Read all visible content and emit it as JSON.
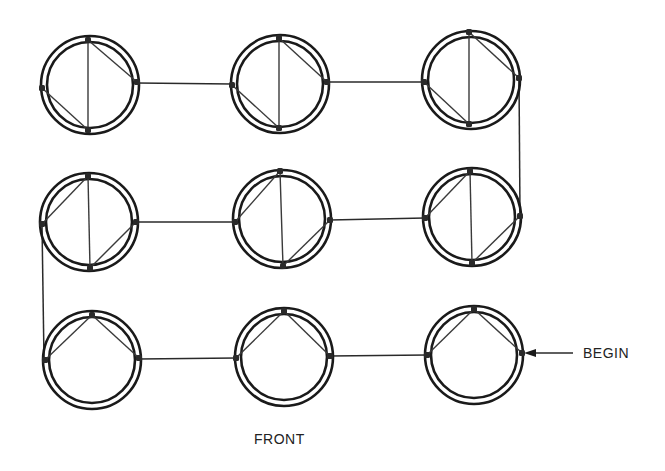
{
  "diagram": {
    "colors": {
      "stroke": "#1a1a1a",
      "background": "#ffffff"
    },
    "ring": {
      "outer_r": 49,
      "inner_r": 43
    },
    "labels": {
      "begin": "BEGIN",
      "front": "FRONT"
    },
    "cells": [
      {
        "id": "r1c1",
        "cx": 90,
        "cy": 85,
        "top": [
          88,
          40
        ],
        "bottom": [
          88,
          130
        ],
        "left": [
          42,
          88
        ],
        "right": [
          137,
          82
        ],
        "chords": [
          [
            "top",
            "bottom"
          ],
          [
            "top",
            "right"
          ],
          [
            "left",
            "bottom"
          ]
        ]
      },
      {
        "id": "r1c2",
        "cx": 280,
        "cy": 84,
        "top": [
          279,
          38
        ],
        "bottom": [
          279,
          128
        ],
        "left": [
          232,
          85
        ],
        "right": [
          327,
          82
        ],
        "chords": [
          [
            "top",
            "bottom"
          ],
          [
            "top",
            "right"
          ],
          [
            "left",
            "bottom"
          ]
        ]
      },
      {
        "id": "r1c3",
        "cx": 471,
        "cy": 80,
        "top": [
          469,
          32
        ],
        "bottom": [
          469,
          124
        ],
        "left": [
          424,
          82
        ],
        "right": [
          519,
          78
        ],
        "chords": [
          [
            "top",
            "bottom"
          ],
          [
            "top",
            "right"
          ],
          [
            "left",
            "bottom"
          ]
        ]
      },
      {
        "id": "r2c1",
        "cx": 89,
        "cy": 222,
        "top": [
          88,
          176
        ],
        "bottom": [
          90,
          268
        ],
        "left": [
          42,
          224
        ],
        "right": [
          136,
          222
        ],
        "chords": [
          [
            "top",
            "bottom"
          ],
          [
            "left",
            "top"
          ],
          [
            "right",
            "bottom"
          ]
        ]
      },
      {
        "id": "r2c2",
        "cx": 282,
        "cy": 219,
        "top": [
          280,
          171
        ],
        "bottom": [
          283,
          266
        ],
        "left": [
          235,
          222
        ],
        "right": [
          330,
          220
        ],
        "chords": [
          [
            "top",
            "bottom"
          ],
          [
            "left",
            "top"
          ],
          [
            "right",
            "bottom"
          ]
        ]
      },
      {
        "id": "r2c3",
        "cx": 472,
        "cy": 217,
        "top": [
          470,
          171
        ],
        "bottom": [
          472,
          263
        ],
        "left": [
          425,
          218
        ],
        "right": [
          520,
          216
        ],
        "chords": [
          [
            "top",
            "bottom"
          ],
          [
            "left",
            "top"
          ],
          [
            "right",
            "bottom"
          ]
        ]
      },
      {
        "id": "r3c1",
        "cx": 92,
        "cy": 360,
        "top": [
          92,
          315
        ],
        "left": [
          45,
          360
        ],
        "right": [
          139,
          358
        ],
        "chords": [
          [
            "left",
            "top"
          ],
          [
            "top",
            "right"
          ]
        ]
      },
      {
        "id": "r3c2",
        "cx": 284,
        "cy": 357,
        "top": [
          284,
          311
        ],
        "left": [
          236,
          358
        ],
        "right": [
          330,
          356
        ],
        "chords": [
          [
            "left",
            "top"
          ],
          [
            "top",
            "right"
          ]
        ]
      },
      {
        "id": "r3c3",
        "cx": 474,
        "cy": 355,
        "top": [
          474,
          309
        ],
        "left": [
          427,
          355
        ],
        "right": [
          522,
          353
        ],
        "chords": [
          [
            "left",
            "top"
          ],
          [
            "top",
            "right"
          ]
        ]
      }
    ],
    "wires": [
      {
        "from": "r1c1.right",
        "to": "r1c2.left",
        "points": [
          [
            137,
            83
          ],
          [
            232,
            84
          ]
        ]
      },
      {
        "from": "r1c2.right",
        "to": "r1c3.left",
        "points": [
          [
            327,
            82
          ],
          [
            424,
            82
          ]
        ]
      },
      {
        "from": "r1c3.right",
        "to": "r2c3.right",
        "points": [
          [
            519,
            78
          ],
          [
            520,
            216
          ]
        ]
      },
      {
        "from": "r2c3.left",
        "to": "r2c2.right",
        "points": [
          [
            425,
            218
          ],
          [
            330,
            220
          ]
        ]
      },
      {
        "from": "r2c2.left",
        "to": "r2c1.right",
        "points": [
          [
            235,
            222
          ],
          [
            136,
            222
          ]
        ]
      },
      {
        "from": "r2c1.left",
        "to": "r3c1.left",
        "points": [
          [
            42,
            224
          ],
          [
            44,
            360
          ]
        ]
      },
      {
        "from": "r3c1.right",
        "to": "r3c2.left",
        "points": [
          [
            139,
            359
          ],
          [
            236,
            358
          ]
        ]
      },
      {
        "from": "r3c2.right",
        "to": "r3c3.left",
        "points": [
          [
            330,
            356
          ],
          [
            427,
            355
          ]
        ]
      }
    ],
    "begin_arrow": {
      "from": [
        573,
        353
      ],
      "to": [
        524,
        353
      ]
    }
  }
}
